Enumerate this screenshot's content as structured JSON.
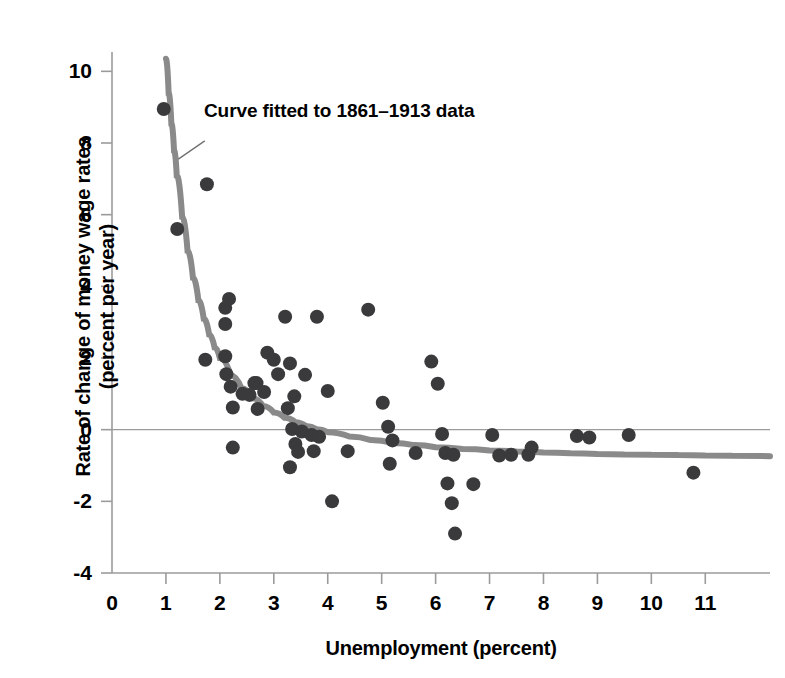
{
  "chart_data": {
    "type": "scatter",
    "title": "",
    "xlabel": "Unemployment (percent)",
    "ylabel_lines": [
      "Rate of change of money wage rates",
      "(percent per year)"
    ],
    "xlabel_full": "Unemployment (percent)",
    "ylabel_full": "Rate of change of money wage rates (percent per year)",
    "xlim": [
      0,
      12.2
    ],
    "ylim": [
      -4,
      10.4
    ],
    "xticks": [
      0,
      1,
      2,
      3,
      4,
      5,
      6,
      7,
      8,
      9,
      10,
      11
    ],
    "xticklabels": [
      "0",
      "1",
      "2",
      "3",
      "4",
      "5",
      "6",
      "7",
      "8",
      "9",
      "10",
      "11"
    ],
    "yticks": [
      -4,
      -2,
      0,
      2,
      4,
      6,
      8,
      10
    ],
    "yticklabels": [
      "-4",
      "-2",
      "0",
      "2",
      "4",
      "6",
      "8",
      "10"
    ],
    "grid": false,
    "zero_line": true,
    "legend_position": "none",
    "annotations": [
      {
        "text": "Curve fitted to 1861–1913 data",
        "x": 1.72,
        "y": 8.1,
        "leader_from_x": 1.72,
        "leader_from_y": 8.06,
        "leader_to_x": 1.23,
        "leader_to_y": 7.55
      }
    ],
    "colors": {
      "point": "#3a3a3c",
      "curve": "#8a8a8a",
      "axis": "#9b9b9b",
      "text": "#000000",
      "background": "#ffffff"
    },
    "point_radius_px": 7,
    "curve_width_px": 6,
    "series": [
      {
        "name": "1861-1913 observations",
        "marker": "circle",
        "points": [
          [
            0.96,
            8.95
          ],
          [
            1.21,
            5.6
          ],
          [
            1.76,
            6.85
          ],
          [
            1.73,
            1.95
          ],
          [
            2.1,
            3.4
          ],
          [
            2.1,
            2.95
          ],
          [
            2.1,
            2.05
          ],
          [
            2.12,
            1.55
          ],
          [
            2.17,
            3.65
          ],
          [
            2.2,
            1.2
          ],
          [
            2.24,
            0.62
          ],
          [
            2.24,
            -0.5
          ],
          [
            2.42,
            1.0
          ],
          [
            2.55,
            0.97
          ],
          [
            2.64,
            1.3
          ],
          [
            2.68,
            1.3
          ],
          [
            2.7,
            0.58
          ],
          [
            2.82,
            1.05
          ],
          [
            2.88,
            2.15
          ],
          [
            3.0,
            1.95
          ],
          [
            3.08,
            1.55
          ],
          [
            3.21,
            3.15
          ],
          [
            3.26,
            0.6
          ],
          [
            3.3,
            1.85
          ],
          [
            3.3,
            -1.05
          ],
          [
            3.34,
            0.02
          ],
          [
            3.38,
            0.93
          ],
          [
            3.4,
            -0.4
          ],
          [
            3.45,
            -0.62
          ],
          [
            3.52,
            -0.05
          ],
          [
            3.58,
            1.53
          ],
          [
            3.7,
            -0.15
          ],
          [
            3.74,
            -0.6
          ],
          [
            3.8,
            3.15
          ],
          [
            3.84,
            -0.2
          ],
          [
            4.0,
            1.08
          ],
          [
            4.08,
            -2.0
          ],
          [
            4.37,
            -0.6
          ],
          [
            4.75,
            3.35
          ],
          [
            5.02,
            0.75
          ],
          [
            5.12,
            0.08
          ],
          [
            5.15,
            -0.95
          ],
          [
            5.2,
            -0.3
          ],
          [
            5.63,
            -0.65
          ],
          [
            5.92,
            1.9
          ],
          [
            6.04,
            1.28
          ],
          [
            6.12,
            -0.12
          ],
          [
            6.18,
            -0.65
          ],
          [
            6.22,
            -1.5
          ],
          [
            6.3,
            -2.05
          ],
          [
            6.33,
            -0.7
          ],
          [
            6.36,
            -2.9
          ],
          [
            6.7,
            -1.52
          ],
          [
            7.05,
            -0.15
          ],
          [
            7.18,
            -0.72
          ],
          [
            7.4,
            -0.7
          ],
          [
            7.72,
            -0.7
          ],
          [
            7.78,
            -0.5
          ],
          [
            8.62,
            -0.18
          ],
          [
            8.85,
            -0.22
          ],
          [
            9.58,
            -0.15
          ],
          [
            10.78,
            -1.2
          ]
        ]
      }
    ],
    "fitted_curve": {
      "name": "Curve fitted to 1861-1913 data",
      "points": [
        [
          1.0,
          10.35
        ],
        [
          1.05,
          9.4
        ],
        [
          1.1,
          8.55
        ],
        [
          1.15,
          7.8
        ],
        [
          1.2,
          7.1
        ],
        [
          1.3,
          5.95
        ],
        [
          1.4,
          5.0
        ],
        [
          1.5,
          4.25
        ],
        [
          1.6,
          3.62
        ],
        [
          1.7,
          3.1
        ],
        [
          1.8,
          2.66
        ],
        [
          1.9,
          2.3
        ],
        [
          2.0,
          2.0
        ],
        [
          2.2,
          1.52
        ],
        [
          2.4,
          1.16
        ],
        [
          2.6,
          0.88
        ],
        [
          2.8,
          0.66
        ],
        [
          3.0,
          0.48
        ],
        [
          3.2,
          0.33
        ],
        [
          3.4,
          0.21
        ],
        [
          3.6,
          0.1
        ],
        [
          3.8,
          0.01
        ],
        [
          4.0,
          -0.07
        ],
        [
          4.4,
          -0.19
        ],
        [
          4.8,
          -0.29
        ],
        [
          5.2,
          -0.37
        ],
        [
          5.6,
          -0.43
        ],
        [
          6.0,
          -0.49
        ],
        [
          6.5,
          -0.54
        ],
        [
          7.0,
          -0.58
        ],
        [
          7.5,
          -0.61
        ],
        [
          8.0,
          -0.64
        ],
        [
          8.5,
          -0.66
        ],
        [
          9.0,
          -0.68
        ],
        [
          9.5,
          -0.69
        ],
        [
          10.0,
          -0.7
        ],
        [
          10.5,
          -0.71
        ],
        [
          11.0,
          -0.72
        ],
        [
          11.5,
          -0.73
        ],
        [
          12.2,
          -0.74
        ]
      ]
    }
  }
}
